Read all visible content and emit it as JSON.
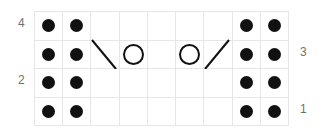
{
  "chart_data": {
    "type": "table",
    "title": "",
    "subtitle": "",
    "xlabel": "",
    "ylabel": "",
    "columns": 9,
    "rows": 4,
    "grid": true,
    "legend_position": "none",
    "symbol_legend": {
      "dot": "purl-stitch",
      "circle": "yarn-over",
      "backslash": "left-leaning-decrease",
      "slash": "right-leaning-decrease",
      "empty": "knit-stitch"
    },
    "colors": {
      "background": "#ffffff",
      "gridline": "#e6e6e6",
      "symbol": "#111111",
      "label": "#6f6f6f"
    },
    "row_labels_left": [
      "4",
      "",
      "2",
      ""
    ],
    "row_labels_right": [
      "",
      "3",
      "",
      "1"
    ],
    "row_numbers_top_to_bottom": [
      "4",
      "3",
      "2",
      "1"
    ],
    "cells": [
      [
        "dot",
        "dot",
        "empty",
        "empty",
        "empty",
        "empty",
        "empty",
        "dot",
        "dot"
      ],
      [
        "dot",
        "dot",
        "backslash",
        "circle",
        "empty",
        "circle",
        "slash",
        "dot",
        "dot"
      ],
      [
        "dot",
        "dot",
        "empty",
        "empty",
        "empty",
        "empty",
        "empty",
        "dot",
        "dot"
      ],
      [
        "dot",
        "dot",
        "empty",
        "empty",
        "empty",
        "empty",
        "empty",
        "dot",
        "dot"
      ]
    ]
  },
  "labels": {
    "left": {
      "row4": "4",
      "row2": "2"
    },
    "right": {
      "row3": "3",
      "row1": "1"
    }
  }
}
